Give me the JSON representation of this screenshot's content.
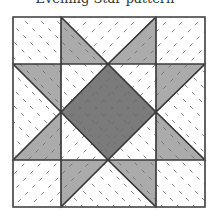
{
  "caption": "Evening Star pattern",
  "colors": {
    "background": "#ffffff",
    "light_patch": "#ffffff",
    "medium_patch": "#ababab",
    "dark_patch": "#7b7b7b",
    "seam": "#3a3a3a",
    "quilting": "#6a6a6a"
  },
  "block": {
    "x": 13,
    "y": 17,
    "size": 192,
    "grid": [
      13,
      61,
      156,
      205
    ],
    "rows": [
      17,
      64,
      160,
      207
    ]
  },
  "pieces": [
    {
      "name": "corner-top-left",
      "kind": "square",
      "fill": "light",
      "points": [
        [
          13,
          17
        ],
        [
          61,
          17
        ],
        [
          61,
          64
        ],
        [
          13,
          64
        ]
      ]
    },
    {
      "name": "corner-top-right",
      "kind": "square",
      "fill": "light",
      "points": [
        [
          156,
          17
        ],
        [
          205,
          17
        ],
        [
          205,
          64
        ],
        [
          156,
          64
        ]
      ]
    },
    {
      "name": "corner-bottom-left",
      "kind": "square",
      "fill": "light",
      "points": [
        [
          13,
          160
        ],
        [
          61,
          160
        ],
        [
          61,
          207
        ],
        [
          13,
          207
        ]
      ]
    },
    {
      "name": "corner-bottom-right",
      "kind": "square",
      "fill": "light",
      "points": [
        [
          156,
          160
        ],
        [
          205,
          160
        ],
        [
          205,
          207
        ],
        [
          156,
          207
        ]
      ]
    },
    {
      "name": "top-goose-body",
      "kind": "triangle",
      "fill": "light",
      "points": [
        [
          61,
          17
        ],
        [
          156,
          17
        ],
        [
          108,
          64
        ]
      ]
    },
    {
      "name": "top-goose-wing-left",
      "kind": "triangle",
      "fill": "medium",
      "points": [
        [
          61,
          17
        ],
        [
          108,
          64
        ],
        [
          61,
          64
        ]
      ]
    },
    {
      "name": "top-goose-wing-right",
      "kind": "triangle",
      "fill": "medium",
      "points": [
        [
          156,
          17
        ],
        [
          156,
          64
        ],
        [
          108,
          64
        ]
      ]
    },
    {
      "name": "bottom-goose-body",
      "kind": "triangle",
      "fill": "light",
      "points": [
        [
          61,
          207
        ],
        [
          156,
          207
        ],
        [
          108,
          160
        ]
      ]
    },
    {
      "name": "bottom-goose-wing-left",
      "kind": "triangle",
      "fill": "medium",
      "points": [
        [
          61,
          160
        ],
        [
          108,
          160
        ],
        [
          61,
          207
        ]
      ]
    },
    {
      "name": "bottom-goose-wing-right",
      "kind": "triangle",
      "fill": "medium",
      "points": [
        [
          156,
          160
        ],
        [
          156,
          207
        ],
        [
          108,
          160
        ]
      ]
    },
    {
      "name": "left-goose-body",
      "kind": "triangle",
      "fill": "light",
      "points": [
        [
          13,
          64
        ],
        [
          13,
          160
        ],
        [
          61,
          112
        ]
      ]
    },
    {
      "name": "left-goose-wing-top",
      "kind": "triangle",
      "fill": "medium",
      "points": [
        [
          13,
          64
        ],
        [
          61,
          64
        ],
        [
          61,
          112
        ]
      ]
    },
    {
      "name": "left-goose-wing-bottom",
      "kind": "triangle",
      "fill": "medium",
      "points": [
        [
          13,
          160
        ],
        [
          61,
          112
        ],
        [
          61,
          160
        ]
      ]
    },
    {
      "name": "right-goose-body",
      "kind": "triangle",
      "fill": "light",
      "points": [
        [
          205,
          64
        ],
        [
          205,
          160
        ],
        [
          156,
          112
        ]
      ]
    },
    {
      "name": "right-goose-wing-top",
      "kind": "triangle",
      "fill": "medium",
      "points": [
        [
          156,
          64
        ],
        [
          205,
          64
        ],
        [
          156,
          112
        ]
      ]
    },
    {
      "name": "right-goose-wing-bottom",
      "kind": "triangle",
      "fill": "medium",
      "points": [
        [
          156,
          112
        ],
        [
          205,
          160
        ],
        [
          156,
          160
        ]
      ]
    },
    {
      "name": "center-corner-top-left",
      "kind": "triangle",
      "fill": "light",
      "points": [
        [
          61,
          64
        ],
        [
          108,
          64
        ],
        [
          61,
          112
        ]
      ]
    },
    {
      "name": "center-corner-top-right",
      "kind": "triangle",
      "fill": "light",
      "points": [
        [
          108,
          64
        ],
        [
          156,
          64
        ],
        [
          156,
          112
        ]
      ]
    },
    {
      "name": "center-corner-bottom-left",
      "kind": "triangle",
      "fill": "light",
      "points": [
        [
          61,
          112
        ],
        [
          61,
          160
        ],
        [
          108,
          160
        ]
      ]
    },
    {
      "name": "center-corner-bottom-right",
      "kind": "triangle",
      "fill": "light",
      "points": [
        [
          156,
          112
        ],
        [
          156,
          160
        ],
        [
          108,
          160
        ]
      ]
    },
    {
      "name": "center-diamond",
      "kind": "diamond",
      "fill": "dark",
      "points": [
        [
          108,
          64
        ],
        [
          156,
          112
        ],
        [
          108,
          160
        ],
        [
          61,
          112
        ]
      ]
    }
  ]
}
